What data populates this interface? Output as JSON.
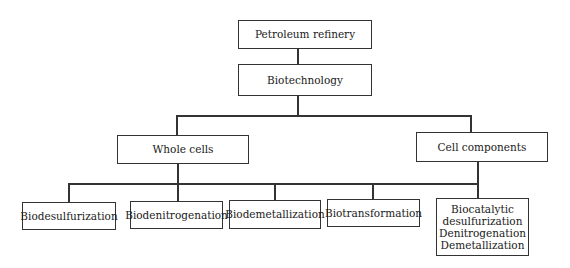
{
  "diagram": {
    "type": "hierarchy",
    "root": {
      "label": "Petroleum refinery"
    },
    "level1": {
      "label": "Biotechnology"
    },
    "level2": [
      {
        "label": "Whole cells"
      },
      {
        "label": "Cell components"
      }
    ],
    "whole_cells_children": [
      {
        "label": "Biodesulfurization"
      },
      {
        "label": "Biodenitrogenation"
      },
      {
        "label": "Biodemetallization"
      },
      {
        "label": "Biotransformation"
      }
    ],
    "cell_components_children": [
      {
        "lines": [
          "Biocatalytic",
          "desulfurization",
          "Denitrogenation",
          "Demetallization"
        ]
      }
    ],
    "colors": {
      "stroke": "#333333",
      "background": "#ffffff",
      "text": "#1a1a1a"
    }
  }
}
